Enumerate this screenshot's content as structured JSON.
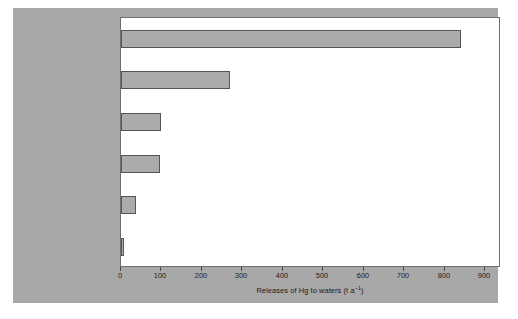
{
  "chart_data": {
    "type": "bar",
    "orientation": "horizontal",
    "title": "",
    "xlabel": "Releases of Hg to waters (t a⁻¹)",
    "ylabel": "",
    "xlim": [
      0,
      900
    ],
    "xticks": [
      0,
      100,
      200,
      300,
      400,
      500,
      600,
      700,
      800,
      900
    ],
    "xtick_labels": [
      "0",
      "100",
      "200",
      "300",
      "400",
      "500",
      "600",
      "700",
      "800",
      "900"
    ],
    "grid": false,
    "legend": null,
    "categories": [
      "Artisanal gold mining",
      "Deforestation (soil erosion)",
      "Metal processing",
      "Consumer waste",
      "Diffuse pollution",
      "Chlor-alkali industry"
    ],
    "values": [
      810,
      260,
      95,
      92,
      35,
      5
    ],
    "units": "t a-1",
    "bar_fill_color": "#ababab",
    "bar_edge_color": "#555555",
    "plot_background": "#ffffff",
    "panel_background": "#a8a8a8",
    "axis_color": "#6e6e6e"
  },
  "axis": {
    "title_main": "Releases of Hg to waters (t a",
    "title_sup": "−1",
    "title_tail": ")"
  },
  "categories": {
    "c0": "Artisanal gold mining",
    "c1_line1": "Deforestation (soil",
    "c1_line2": "erosion)",
    "c2": "Metal processing",
    "c3": "Consumer waste",
    "c4": "Diffuse pollution",
    "c5": "Chlor-alkali industry"
  },
  "ticks": {
    "t0": "0",
    "t1": "100",
    "t2": "200",
    "t3": "300",
    "t4": "400",
    "t5": "500",
    "t6": "600",
    "t7": "700",
    "t8": "800",
    "t9": "900"
  }
}
